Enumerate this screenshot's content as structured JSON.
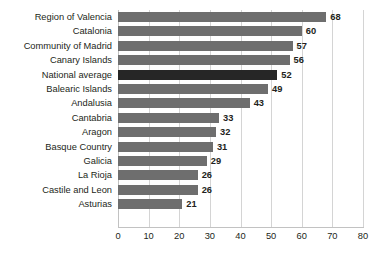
{
  "chart_data": {
    "type": "bar",
    "orientation": "horizontal",
    "title": "",
    "subtitle": "",
    "xlabel": "",
    "ylabel": "",
    "xlim": [
      0,
      80
    ],
    "xticks": [
      0,
      10,
      20,
      30,
      40,
      50,
      60,
      70,
      80
    ],
    "grid": true,
    "legend": null,
    "categories": [
      "Region of Valencia",
      "Catalonia",
      "Community of Madrid",
      "Canary Islands",
      "National average",
      "Balearic Islands",
      "Andalusia",
      "Cantabria",
      "Aragon",
      "Basque Country",
      "Galicia",
      "La Rioja",
      "Castile and Leon",
      "Asturias"
    ],
    "values": [
      68,
      60,
      57,
      56,
      52,
      49,
      43,
      33,
      32,
      31,
      29,
      26,
      26,
      21
    ],
    "highlight_category": "National average",
    "colors": {
      "bar": "#6e6e6e",
      "bar_highlight": "#262626",
      "gridline": "#d4d4d4",
      "axis": "#c2c2c2",
      "text": "#231f20",
      "background": "#ffffff"
    }
  }
}
